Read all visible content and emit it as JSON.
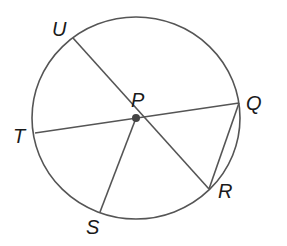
{
  "diagram": {
    "type": "circle-geometry",
    "center": {
      "label": "P",
      "x": 136,
      "y": 118
    },
    "circle": {
      "cx": 136,
      "cy": 118,
      "rx": 104,
      "ry": 101
    },
    "points": [
      {
        "label": "U",
        "x": 73,
        "y": 38,
        "label_x": 52,
        "label_y": 36
      },
      {
        "label": "Q",
        "x": 239,
        "y": 103,
        "label_x": 246,
        "label_y": 110
      },
      {
        "label": "R",
        "x": 209,
        "y": 189,
        "label_x": 218,
        "label_y": 198
      },
      {
        "label": "S",
        "x": 100,
        "y": 212,
        "label_x": 86,
        "label_y": 234
      },
      {
        "label": "T",
        "x": 35,
        "y": 133,
        "label_x": 13,
        "label_y": 143
      }
    ],
    "segments": [
      {
        "from": "U",
        "to": "R",
        "note": "diameter through P"
      },
      {
        "from": "T",
        "to": "Q",
        "note": "diameter through P"
      },
      {
        "from": "P",
        "to": "S",
        "note": "radius"
      },
      {
        "from": "Q",
        "to": "R",
        "note": "chord"
      }
    ],
    "labels": {
      "P": "P",
      "Q": "Q",
      "R": "R",
      "S": "S",
      "T": "T",
      "U": "U"
    },
    "colors": {
      "line": "#555555",
      "text": "#1a1a1a",
      "center_dot": "#444444"
    }
  }
}
